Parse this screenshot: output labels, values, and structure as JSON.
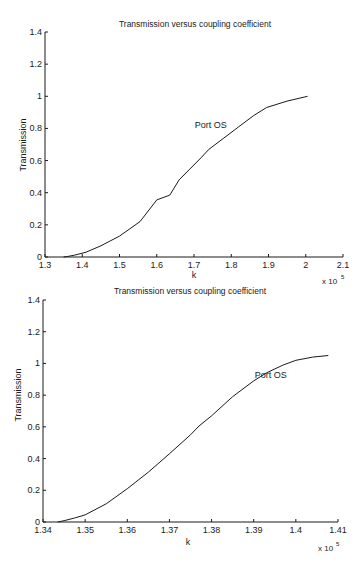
{
  "chart_data": [
    {
      "type": "line",
      "title": "Transmission versus coupling coefficient",
      "xlabel": "k",
      "ylabel": "Transmission",
      "x_multiplier": "x 10",
      "x_multiplier_exp": "5",
      "xlim": [
        1.3,
        2.1
      ],
      "ylim": [
        0,
        1.4
      ],
      "xticks": [
        1.3,
        1.4,
        1.5,
        1.6,
        1.7,
        1.8,
        1.9,
        2.0,
        2.1
      ],
      "xtick_labels": [
        "1.3",
        "1.4",
        "1.5",
        "1.6",
        "1.7",
        "1.8",
        "1.9",
        "2",
        "2.1"
      ],
      "yticks": [
        0,
        0.2,
        0.4,
        0.6,
        0.8,
        1.0,
        1.2,
        1.4
      ],
      "ytick_labels": [
        "0",
        "0.2",
        "0.4",
        "0.6",
        "0.8",
        "1",
        "1.2",
        "1.4"
      ],
      "grid": false,
      "legend": null,
      "annotations": [
        {
          "text": "Port OS",
          "x": 1.75,
          "y": 0.82
        }
      ],
      "series": [
        {
          "name": "Port OS",
          "x": [
            1.35,
            1.36,
            1.38,
            1.41,
            1.45,
            1.5,
            1.555,
            1.6,
            1.635,
            1.66,
            1.72,
            1.74,
            1.78,
            1.82,
            1.86,
            1.895,
            1.95,
            2.005
          ],
          "y": [
            0.0,
            0.003,
            0.012,
            0.03,
            0.07,
            0.13,
            0.22,
            0.355,
            0.385,
            0.48,
            0.62,
            0.67,
            0.74,
            0.81,
            0.88,
            0.93,
            0.97,
            1.0
          ]
        }
      ],
      "plot_box": {
        "x0": 45,
        "x1": 343,
        "y0": 257,
        "y1": 32
      }
    },
    {
      "type": "line",
      "title": "Transmission versus coupling coefficient",
      "xlabel": "k",
      "ylabel": "Transmission",
      "x_multiplier": "x 10",
      "x_multiplier_exp": "5",
      "xlim": [
        1.34,
        1.41
      ],
      "ylim": [
        0,
        1.4
      ],
      "xticks": [
        1.34,
        1.35,
        1.36,
        1.37,
        1.38,
        1.39,
        1.4,
        1.41
      ],
      "xtick_labels": [
        "1.34",
        "1.35",
        "1.36",
        "1.37",
        "1.38",
        "1.39",
        "1.4",
        "1.41"
      ],
      "yticks": [
        0,
        0.2,
        0.4,
        0.6,
        0.8,
        1.0,
        1.2,
        1.4
      ],
      "ytick_labels": [
        "0",
        "0.2",
        "0.4",
        "0.6",
        "0.8",
        "1",
        "1.2",
        "1.4"
      ],
      "grid": false,
      "legend": null,
      "annotations": [
        {
          "text": "Port OS",
          "x": 1.3945,
          "y": 0.93
        }
      ],
      "series": [
        {
          "name": "Port OS",
          "x": [
            1.3435,
            1.345,
            1.3475,
            1.35,
            1.355,
            1.36,
            1.365,
            1.37,
            1.375,
            1.377,
            1.38,
            1.385,
            1.39,
            1.393,
            1.397,
            1.4,
            1.404,
            1.4077
          ],
          "y": [
            0.0,
            0.008,
            0.025,
            0.045,
            0.115,
            0.21,
            0.315,
            0.43,
            0.55,
            0.605,
            0.67,
            0.79,
            0.89,
            0.94,
            0.99,
            1.02,
            1.04,
            1.05
          ]
        }
      ],
      "plot_box": {
        "x0": 43,
        "x1": 338,
        "y0": 522,
        "y1": 300
      }
    }
  ]
}
